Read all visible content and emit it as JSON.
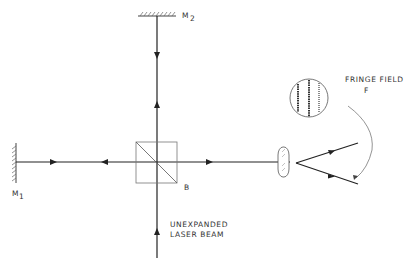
{
  "diagram": {
    "type": "optical-interferometer-schematic",
    "labels": {
      "mirror_top": "M",
      "mirror_top_sub": "2",
      "mirror_left": "M",
      "mirror_left_sub": "1",
      "beamsplitter": "B",
      "fringe_field_line1": "FRINGE FIELD",
      "fringe_field_line2": "F",
      "source_line1": "UNEXPANDED",
      "source_line2": "LASER BEAM"
    },
    "components": [
      {
        "id": "M1",
        "kind": "mirror",
        "position": "left"
      },
      {
        "id": "M2",
        "kind": "mirror",
        "position": "top"
      },
      {
        "id": "B",
        "kind": "beam-splitter-cube",
        "position": "center"
      },
      {
        "id": "lens",
        "kind": "lens",
        "position": "right"
      },
      {
        "id": "F",
        "kind": "fringe-field",
        "position": "top-right"
      }
    ],
    "colors": {
      "line": "#222222",
      "thin": "#555555"
    }
  }
}
